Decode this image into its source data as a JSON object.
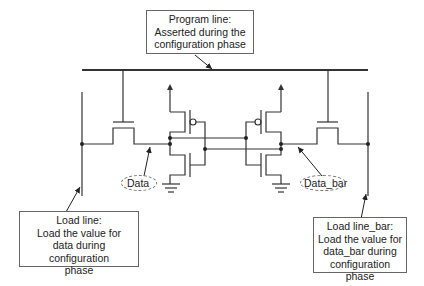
{
  "diagram": {
    "type": "circuit-schematic",
    "callouts": {
      "program_line": [
        "Program line:",
        "Asserted during the",
        "configuration phase"
      ],
      "load_line": [
        "Load line:",
        "Load the value for",
        "data during configuration",
        "phase"
      ],
      "load_line_bar": [
        "Load line_bar:",
        "Load the value for",
        "data_bar during",
        "configuration phase"
      ]
    },
    "nodes": {
      "data": "Data",
      "data_bar": "Data_bar"
    },
    "colors": {
      "wire": "#333333",
      "box_border": "#666666"
    }
  }
}
